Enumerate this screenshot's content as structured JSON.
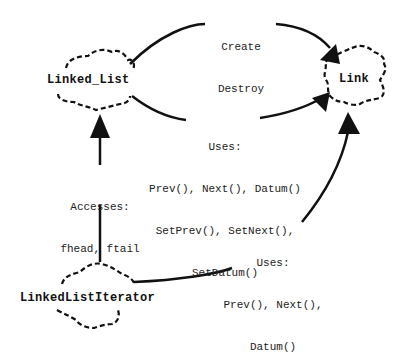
{
  "diagram": {
    "nodes": [
      {
        "id": "linked_list",
        "label": "Linked_List"
      },
      {
        "id": "link",
        "label": "Link"
      },
      {
        "id": "iterator",
        "label": "LinkedListIterator"
      }
    ],
    "edges": [
      {
        "from": "linked_list",
        "to": "link",
        "label_lines": [
          "Create",
          "Destroy"
        ]
      },
      {
        "from": "linked_list",
        "to": "link",
        "label_lines": [
          "Uses:",
          "Prev(), Next(), Datum()",
          "SetPrev(), SetNext(),",
          "SetDatum()"
        ]
      },
      {
        "from": "iterator",
        "to": "linked_list",
        "label_lines": [
          "Accesses:",
          "fhead, ftail"
        ]
      },
      {
        "from": "iterator",
        "to": "link",
        "label_lines": [
          "Uses:",
          "Prev(), Next(),",
          "Datum()"
        ]
      }
    ],
    "colors": {
      "line": "#111111",
      "text": "#222222",
      "background": "#ffffff"
    }
  }
}
